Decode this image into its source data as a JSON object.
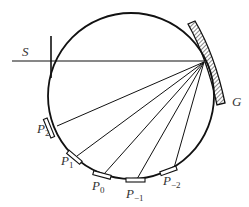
{
  "diagram": {
    "labels": {
      "source": "S",
      "grating": "G",
      "plates": [
        {
          "base": "P",
          "sub": "2"
        },
        {
          "base": "P",
          "sub": "1"
        },
        {
          "base": "P",
          "sub": "0"
        },
        {
          "base": "P",
          "sub": "−1"
        },
        {
          "base": "P",
          "sub": "−2"
        }
      ]
    },
    "colors": {
      "stroke": "#111111",
      "background": "#ffffff"
    }
  }
}
